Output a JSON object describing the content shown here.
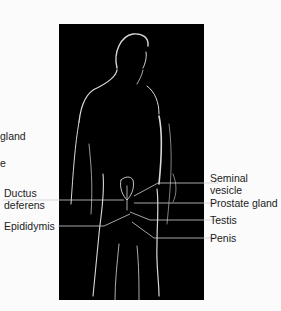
{
  "figure": {
    "background_color": "#fbfbfb",
    "panel_color": "#000000",
    "leader_line_color": "#cfcfcf"
  },
  "labels_left": [
    {
      "id": "gland-partial",
      "text": "gland"
    },
    {
      "id": "e-partial",
      "text": "e"
    },
    {
      "id": "ductus-deferens",
      "line1": "Ductus",
      "line2": "deferens"
    },
    {
      "id": "epididymis",
      "text": "Epididymis"
    }
  ],
  "labels_right": [
    {
      "id": "seminal-vesicle",
      "line1": "Seminal",
      "line2": "vesicle"
    },
    {
      "id": "prostate-gland",
      "text": "Prostate gland"
    },
    {
      "id": "testis",
      "text": "Testis"
    },
    {
      "id": "penis",
      "text": "Penis"
    }
  ]
}
